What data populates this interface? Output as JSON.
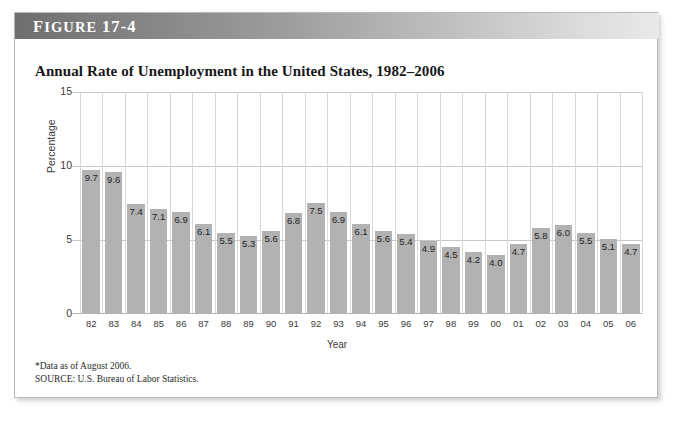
{
  "figure": {
    "banner_label": "Figure 17-4",
    "banner_prefix_caps": "F",
    "title": "Annual Rate of Unemployment in the United States, 1982–2006",
    "footnote_data": "*Data as of August 2006.",
    "footnote_source": "SOURCE: U.S. Bureau of Labor Statistics."
  },
  "colors": {
    "bar": "#b2b2b2",
    "gridline": "#c8c8c8",
    "banner_dark": "#6e6e6e",
    "banner_light": "#e9e9e9",
    "card_border": "#b9b9b9",
    "text": "#17171a"
  },
  "chart_data": {
    "type": "bar",
    "title": "Annual Rate of Unemployment in the United States, 1982–2006",
    "xlabel": "Year",
    "ylabel": "Percentage",
    "ylim": [
      0,
      15
    ],
    "yticks": [
      0,
      5,
      10,
      15
    ],
    "ytick_labels": [
      "0",
      "5",
      "10",
      "15"
    ],
    "grid": "horizontal-and-vertical",
    "legend": "none",
    "categories": [
      "82",
      "83",
      "84",
      "85",
      "86",
      "87",
      "88",
      "89",
      "90",
      "91",
      "92",
      "93",
      "94",
      "95",
      "96",
      "97",
      "98",
      "99",
      "00",
      "01",
      "02",
      "03",
      "04",
      "05",
      "06"
    ],
    "values": [
      9.7,
      9.6,
      7.4,
      7.1,
      6.9,
      6.1,
      5.5,
      5.3,
      5.6,
      6.8,
      7.5,
      6.9,
      6.1,
      5.6,
      5.4,
      4.9,
      4.5,
      4.2,
      4.0,
      4.7,
      5.8,
      6.0,
      5.5,
      5.1,
      4.7
    ],
    "value_labels": [
      "9.7",
      "9.6",
      "7.4",
      "7.1",
      "6.9",
      "6.1",
      "5.5",
      "5.3",
      "5.6",
      "6.8",
      "7.5",
      "6.9",
      "6.1",
      "5.6",
      "5.4",
      "4.9",
      "4.5",
      "4.2",
      "4.0",
      "4.7",
      "5.8",
      "6.0",
      "5.5",
      "5.1",
      "4.7"
    ],
    "annotations": [
      "*Data as of August 2006.",
      "SOURCE: U.S. Bureau of Labor Statistics."
    ]
  }
}
